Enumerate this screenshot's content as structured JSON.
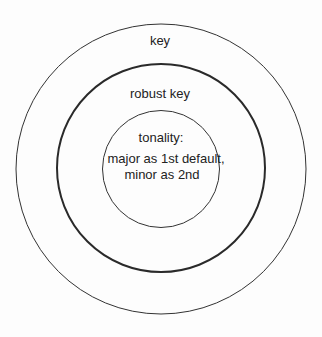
{
  "diagram": {
    "type": "nested-circles",
    "colors": {
      "background": "#fdfdfd",
      "stroke": "#333333",
      "text": "#222222"
    },
    "circles": [
      {
        "id": "outer",
        "label": "key",
        "stroke_width": 1
      },
      {
        "id": "middle",
        "label": "robust key",
        "stroke_width": 2
      },
      {
        "id": "inner",
        "label": "tonality:",
        "body_lines": [
          "major as 1st default,",
          "minor as 2nd"
        ],
        "stroke_width": 1
      }
    ]
  }
}
